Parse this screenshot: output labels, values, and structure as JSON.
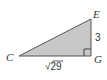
{
  "diagram": {
    "type": "right-triangle",
    "fill_color": "#c8c8c8",
    "stroke_color": "#555555",
    "vertices": {
      "C": {
        "label": "C",
        "x": 19,
        "y": 56
      },
      "E": {
        "label": "E",
        "x": 91,
        "y": 19
      },
      "G": {
        "label": "G",
        "x": 91,
        "y": 56
      }
    },
    "right_angle_at": "G",
    "sides": {
      "EG": {
        "label": "3"
      },
      "CG": {
        "label": "√29"
      }
    }
  }
}
